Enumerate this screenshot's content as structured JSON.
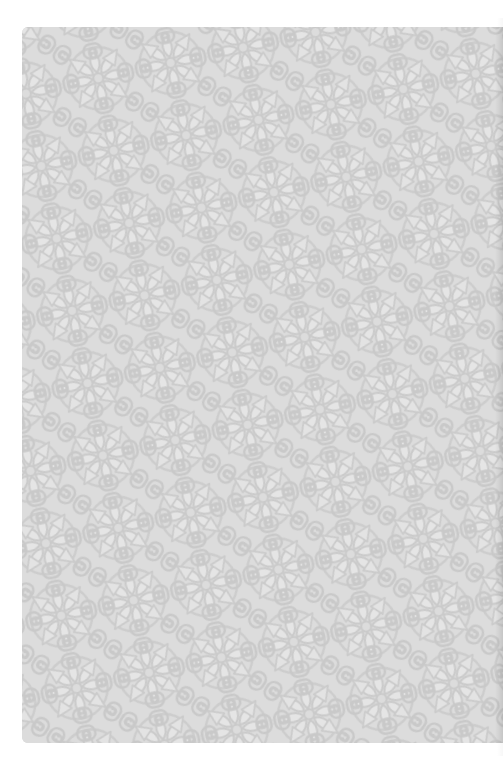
{
  "page": {
    "type": "scanned-book-page"
  },
  "header": {
    "text": ""
  },
  "footer": {
    "text": ""
  },
  "endpaper": {
    "pattern": "rosettes-and-scrolls",
    "colors": {
      "paper": "#ffffff",
      "background": "#d8d8d8",
      "motif": "#c3c3c3",
      "highlight": "#e4e4e4"
    }
  }
}
